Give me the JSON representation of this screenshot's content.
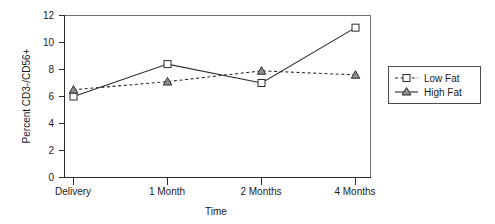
{
  "chart_data": {
    "type": "line",
    "title": "",
    "xlabel": "Time",
    "ylabel": "Percent CD3-/CD56+",
    "categories": [
      "Delivery",
      "1 Month",
      "2 Months",
      "4 Months"
    ],
    "ylim": [
      0,
      12
    ],
    "yticks": [
      0,
      2,
      4,
      6,
      8,
      10,
      12
    ],
    "ytick_labels": [
      "0",
      "2",
      "4",
      "6",
      "8",
      "10",
      "12"
    ],
    "grid": false,
    "legend_position": "right",
    "series": [
      {
        "name": "Low Fat",
        "marker": "square",
        "linestyle": "dashed",
        "values": [
          6.5,
          7.1,
          7.9,
          7.6
        ]
      },
      {
        "name": "High Fat",
        "marker": "triangle",
        "linestyle": "solid",
        "values": [
          6.0,
          8.4,
          7.0,
          11.1
        ]
      }
    ],
    "drawn_series": [
      {
        "name": "solid-square-series",
        "marker": "square",
        "linestyle": "solid",
        "values": [
          6.0,
          8.4,
          7.0,
          11.1
        ]
      },
      {
        "name": "dashed-triangle-series",
        "marker": "triangle",
        "linestyle": "dashed",
        "values": [
          6.5,
          7.1,
          7.9,
          7.6
        ]
      }
    ]
  },
  "legend": {
    "entries": [
      {
        "label": "Low Fat",
        "marker": "square",
        "linestyle": "dashed"
      },
      {
        "label": "High Fat",
        "marker": "triangle",
        "linestyle": "solid"
      }
    ]
  },
  "axes": {
    "y_title": "Percent CD3-/CD56+",
    "x_title": "Time",
    "y_tick_0": "0",
    "y_tick_1": "2",
    "y_tick_2": "4",
    "y_tick_3": "6",
    "y_tick_4": "8",
    "y_tick_5": "10",
    "y_tick_6": "12",
    "x_tick_0": "Delivery",
    "x_tick_1": "1 Month",
    "x_tick_2": "2 Months",
    "x_tick_3": "4 Months"
  },
  "colors": {
    "ink": "#2b2b2b",
    "frame": "#6f6f6f",
    "marker_fill": "#ffffff",
    "triangle_fill": "#8f8f8f",
    "background": "#ffffff"
  }
}
